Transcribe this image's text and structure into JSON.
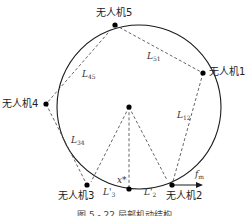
{
  "figure": {
    "caption": "图 5 - 22   局部机动结构",
    "colors": {
      "line": "#1a1a1a",
      "dashed": "#555555",
      "node": "#000000",
      "background": "#ffffff"
    }
  },
  "nodes": {
    "uav1": {
      "label": "无人机1"
    },
    "uav2": {
      "label": "无人机2"
    },
    "uav3": {
      "label": "无人机3"
    },
    "uav4": {
      "label": "无人机4"
    },
    "uav5": {
      "label": "无人机5"
    },
    "center": {
      "label": ""
    },
    "target": {
      "label": "x*"
    }
  },
  "edges": {
    "l51": {
      "main": "L",
      "sub": "51"
    },
    "l45": {
      "main": "L",
      "sub": "45"
    },
    "l12": {
      "main": "L",
      "sub": "12"
    },
    "l34": {
      "main": "L",
      "sub": "34"
    },
    "l3prime": {
      "main": "L'",
      "sub": "3"
    },
    "l2prime": {
      "main": "L'",
      "sub": "2"
    }
  },
  "force": {
    "main": "f",
    "sub": "m"
  }
}
